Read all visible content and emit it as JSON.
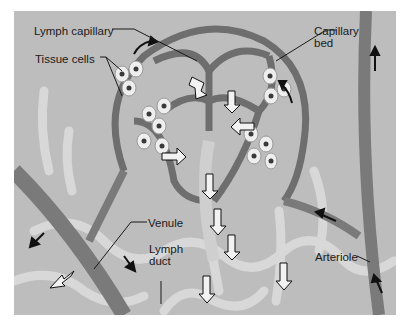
{
  "figure": {
    "labels": {
      "lymph_capillary": "Lymph capillary",
      "tissue_cells": "Tissue cells",
      "capillary_bed_1": "Capillary",
      "capillary_bed_2": "bed",
      "venule": "Venule",
      "lymph_duct_1": "Lymph",
      "lymph_duct_2": "duct",
      "arteriole": "Arteriole"
    },
    "colors": {
      "background": "#bdbdbd",
      "vessel": "#6e6e6e",
      "vessel_light": "#9a9a9a",
      "lymph": "#d6d6d6",
      "cell": "#eeeeee",
      "nucleus": "#3a3a3a",
      "arrow": "#111111"
    }
  }
}
